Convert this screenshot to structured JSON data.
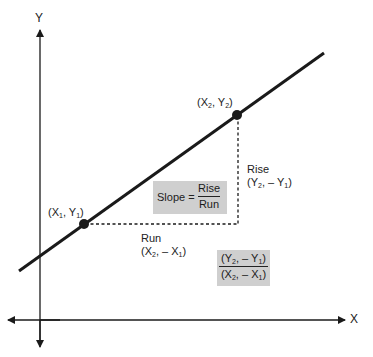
{
  "axes": {
    "x_label": "X",
    "y_label": "Y"
  },
  "points": {
    "p1": {
      "label_pre": "(X",
      "sub1": "1",
      "mid": ", Y",
      "sub2": "1",
      "post": ")"
    },
    "p2": {
      "label_pre": "(X",
      "sub1": "2",
      "mid": ", Y",
      "sub2": "2",
      "post": ")"
    }
  },
  "rise": {
    "title": "Rise",
    "expr_pre": "(Y",
    "sub1": "2",
    "mid": ", – Y",
    "sub2": "1",
    "post": ")"
  },
  "run": {
    "title": "Run",
    "expr_pre": "(X",
    "sub1": "2",
    "mid": ", – X",
    "sub2": "1",
    "post": ")"
  },
  "slope_box": {
    "prefix": "Slope =",
    "numerator": "Rise",
    "denominator": "Run"
  },
  "formula_box": {
    "num_pre": "(Y",
    "num_sub1": "2",
    "num_mid": ", – Y",
    "num_sub2": "1",
    "num_post": ")",
    "den_pre": "(X",
    "den_sub1": "2",
    "den_mid": ", – X",
    "den_sub2": "1",
    "den_post": ")"
  },
  "colors": {
    "line": "#1a1a1a",
    "box_fill": "#cfcfcf",
    "background": "#ffffff"
  }
}
